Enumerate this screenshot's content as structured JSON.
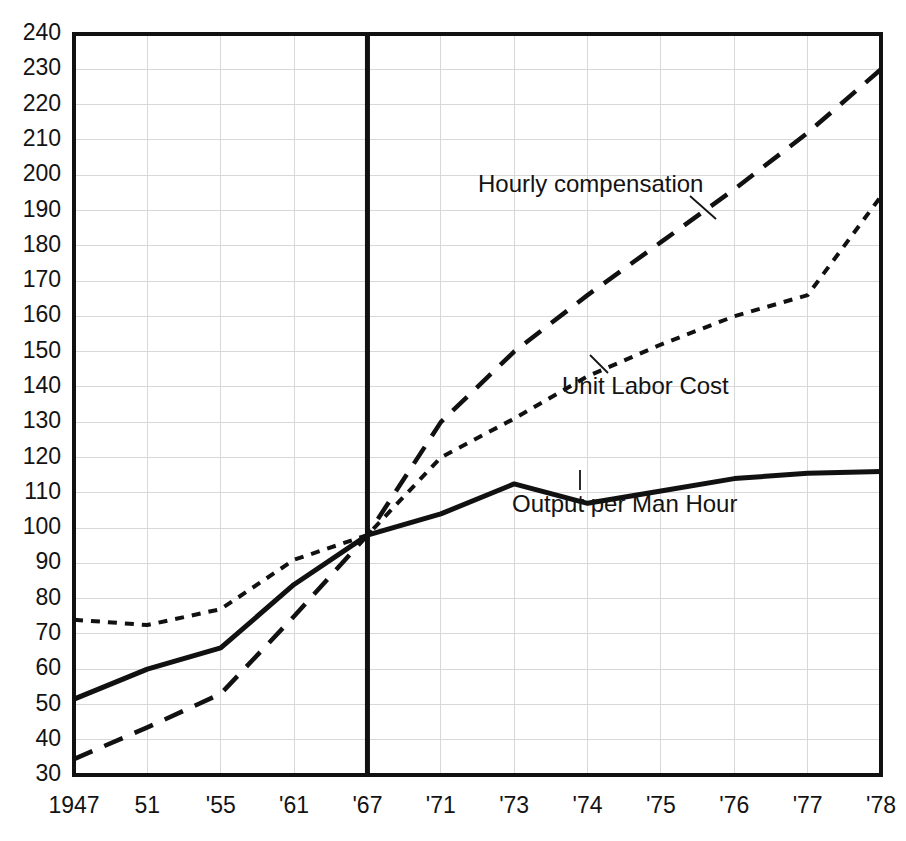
{
  "chart_data": {
    "type": "line",
    "title": "",
    "xlabel": "",
    "ylabel": "",
    "ylim": [
      30,
      240
    ],
    "xlim_categories": true,
    "grid": true,
    "legend_position": "inline-annotations",
    "index_base_year": "'67",
    "categories": [
      "1947",
      "51",
      "'55",
      "'61",
      "'67",
      "'71",
      "'73",
      "'74",
      "'75",
      "'76",
      "'77",
      "'78"
    ],
    "ytick_labels": [
      "240",
      "230",
      "220",
      "210",
      "200",
      "190",
      "180",
      "170",
      "160",
      "150",
      "140",
      "130",
      "120",
      "110",
      "100",
      "90",
      "80",
      "70",
      "60",
      "50",
      "40",
      "30"
    ],
    "ytick_values": [
      240,
      230,
      220,
      210,
      200,
      190,
      180,
      170,
      160,
      150,
      140,
      130,
      120,
      110,
      100,
      90,
      80,
      70,
      60,
      50,
      40,
      30
    ],
    "series": [
      {
        "name": "Hourly compensation",
        "style": "long-dash",
        "values": [
          34.5,
          43.5,
          53,
          75,
          98,
          130,
          150,
          166,
          181,
          196,
          212,
          230
        ]
      },
      {
        "name": "Unit Labor Cost",
        "style": "short-dash",
        "values": [
          74,
          72.5,
          77,
          91,
          98,
          120,
          131,
          143,
          152,
          160,
          166,
          194
        ]
      },
      {
        "name": "Output per Man Hour",
        "style": "solid",
        "values": [
          51.5,
          60,
          66,
          84,
          98,
          104,
          112.5,
          107,
          110.5,
          114,
          115.5,
          116
        ]
      }
    ],
    "annotations": [
      {
        "text": "Hourly compensation",
        "series": "Hourly compensation",
        "label_x": 478,
        "label_y": 186,
        "leader_from_x": 690,
        "leader_from_y": 196,
        "leader_to_x": 716,
        "leader_to_y": 219
      },
      {
        "text": "Unit Labor Cost",
        "series": "Unit Labor Cost",
        "label_x": 562,
        "label_y": 388,
        "leader_from_x": 608,
        "leader_from_y": 373,
        "leader_to_x": 590,
        "leader_to_y": 355
      },
      {
        "text": "Output per Man Hour",
        "series": "Output per Man Hour",
        "label_x": 512,
        "label_y": 506,
        "leader_from_x": 580,
        "leader_from_y": 490,
        "leader_to_x": 580,
        "leader_to_y": 470
      }
    ],
    "colors": {
      "ink": "#111111",
      "grid": "#d8d8d8",
      "background": "#ffffff"
    }
  }
}
